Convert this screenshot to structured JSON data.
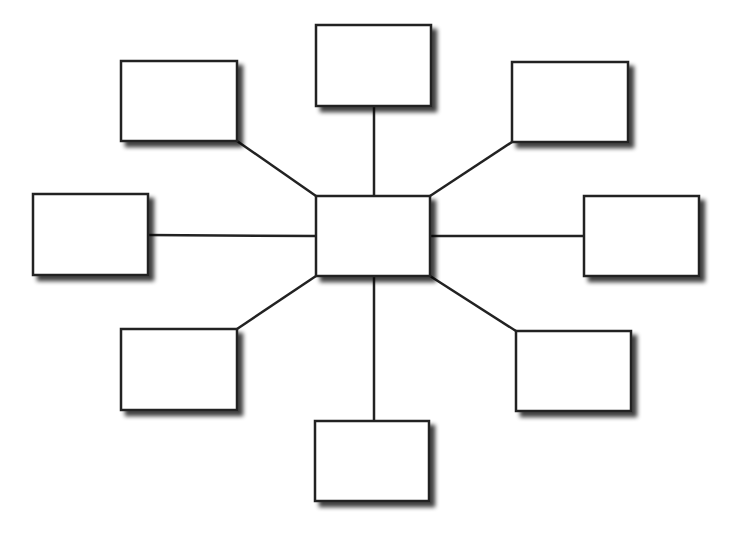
{
  "diagram": {
    "type": "hub-and-spoke",
    "background": "#ffffff",
    "stroke_color": "#222222",
    "fill_color": "#ffffff",
    "shadow_color": "#555555",
    "hub": {
      "id": "center",
      "x": 316,
      "y": 196,
      "w": 114,
      "h": 80,
      "label": ""
    },
    "spokes": [
      {
        "id": "top",
        "x": 316,
        "y": 25,
        "w": 115,
        "h": 81,
        "label": "",
        "from": [
          374,
          106
        ],
        "to": [
          374,
          196
        ]
      },
      {
        "id": "top-left",
        "x": 121,
        "y": 61,
        "w": 116,
        "h": 80,
        "label": "",
        "from": [
          237,
          141
        ],
        "to": [
          316,
          196
        ]
      },
      {
        "id": "top-right",
        "x": 512,
        "y": 62,
        "w": 116,
        "h": 80,
        "label": "",
        "from": [
          512,
          142
        ],
        "to": [
          430,
          196
        ]
      },
      {
        "id": "left",
        "x": 33,
        "y": 194,
        "w": 115,
        "h": 81,
        "label": "",
        "from": [
          148,
          235
        ],
        "to": [
          316,
          236
        ]
      },
      {
        "id": "right",
        "x": 584,
        "y": 196,
        "w": 115,
        "h": 80,
        "label": "",
        "from": [
          584,
          236
        ],
        "to": [
          430,
          236
        ]
      },
      {
        "id": "bottom-left",
        "x": 121,
        "y": 329,
        "w": 116,
        "h": 81,
        "label": "",
        "from": [
          237,
          329
        ],
        "to": [
          316,
          276
        ]
      },
      {
        "id": "bottom-right",
        "x": 516,
        "y": 331,
        "w": 115,
        "h": 80,
        "label": "",
        "from": [
          516,
          331
        ],
        "to": [
          430,
          276
        ]
      },
      {
        "id": "bottom",
        "x": 315,
        "y": 421,
        "w": 114,
        "h": 80,
        "label": "",
        "from": [
          374,
          421
        ],
        "to": [
          374,
          276
        ]
      }
    ]
  }
}
